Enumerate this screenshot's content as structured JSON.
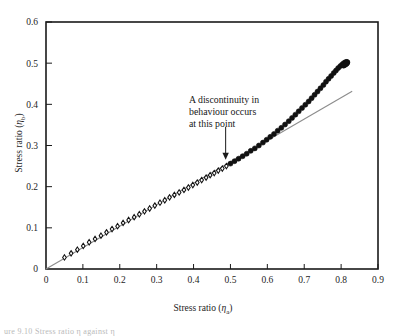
{
  "figure": {
    "caption_fragment": "ure 9.10  Stress  ratio  η   against  η"
  },
  "chart_data": {
    "type": "scatter",
    "title": "",
    "xlabel": "Stress ratio (ηa)",
    "ylabel": "Stress ratio (ηb)",
    "xlabel_main": "Stress ratio (",
    "xlabel_symbol": "η",
    "xlabel_sub": "a",
    "xlabel_close": ")",
    "ylabel_main": "Stress ratio (",
    "ylabel_symbol": "η",
    "ylabel_sub": "b",
    "ylabel_close": ")",
    "xlim": [
      0,
      0.9
    ],
    "ylim": [
      0,
      0.6
    ],
    "xticks": [
      "0",
      "0.1",
      "0.2",
      "0.3",
      "0.4",
      "0.5",
      "0.6",
      "0.7",
      "0.8",
      "0.9"
    ],
    "yticks": [
      "0",
      "0.1",
      "0.2",
      "0.3",
      "0.4",
      "0.5",
      "0.6"
    ],
    "xtick_values": [
      0,
      0.1,
      0.2,
      0.3,
      0.4,
      0.5,
      0.6,
      0.7,
      0.8,
      0.9
    ],
    "ytick_values": [
      0,
      0.1,
      0.2,
      0.3,
      0.4,
      0.5,
      0.6
    ],
    "grid": false,
    "legend": null,
    "marker_color": "#111111",
    "line_color": "#8c8c8c",
    "frame_color": "#1a1a1a",
    "series": [
      {
        "name": "Reference straight line",
        "type": "line",
        "x": [
          0.0,
          0.83
        ],
        "y": [
          0.0,
          0.432
        ]
      },
      {
        "name": "Measured data points",
        "type": "scatter",
        "marker": "open-diamond-below-discontinuity-filled-above",
        "discontinuity_x": 0.49,
        "discontinuity_y": 0.255,
        "x": [
          0.05,
          0.068,
          0.085,
          0.101,
          0.117,
          0.133,
          0.149,
          0.164,
          0.179,
          0.194,
          0.209,
          0.224,
          0.239,
          0.253,
          0.267,
          0.281,
          0.295,
          0.309,
          0.322,
          0.335,
          0.348,
          0.361,
          0.374,
          0.386,
          0.398,
          0.41,
          0.422,
          0.434,
          0.445,
          0.456,
          0.467,
          0.478,
          0.489,
          0.5,
          0.511,
          0.522,
          0.533,
          0.544,
          0.555,
          0.566,
          0.577,
          0.588,
          0.598,
          0.608,
          0.618,
          0.628,
          0.638,
          0.648,
          0.658,
          0.667,
          0.676,
          0.685,
          0.694,
          0.703,
          0.712,
          0.72,
          0.728,
          0.736,
          0.744,
          0.752,
          0.759,
          0.766,
          0.773,
          0.78,
          0.786,
          0.792,
          0.798,
          0.803,
          0.807,
          0.811,
          0.814,
          0.816,
          0.817,
          0.816,
          0.814,
          0.811,
          0.807
        ],
        "y": [
          0.028,
          0.038,
          0.047,
          0.056,
          0.065,
          0.073,
          0.081,
          0.089,
          0.097,
          0.104,
          0.112,
          0.119,
          0.126,
          0.133,
          0.14,
          0.147,
          0.154,
          0.161,
          0.167,
          0.174,
          0.18,
          0.186,
          0.192,
          0.198,
          0.204,
          0.21,
          0.216,
          0.222,
          0.228,
          0.233,
          0.239,
          0.244,
          0.25,
          0.256,
          0.262,
          0.268,
          0.274,
          0.28,
          0.287,
          0.293,
          0.3,
          0.307,
          0.314,
          0.321,
          0.328,
          0.336,
          0.343,
          0.351,
          0.359,
          0.367,
          0.375,
          0.383,
          0.391,
          0.399,
          0.407,
          0.415,
          0.423,
          0.431,
          0.439,
          0.447,
          0.455,
          0.462,
          0.469,
          0.476,
          0.482,
          0.488,
          0.493,
          0.497,
          0.5,
          0.502,
          0.503,
          0.503,
          0.502,
          0.5,
          0.498,
          0.496,
          0.494
        ]
      }
    ],
    "annotations": [
      {
        "name": "discontinuity-note",
        "lines": [
          "A discontinuity in",
          "behaviour occurs",
          "at this point"
        ],
        "arrow_from_x": 0.487,
        "arrow_from_y": 0.345,
        "arrow_to_x": 0.487,
        "arrow_to_y": 0.268
      }
    ]
  }
}
